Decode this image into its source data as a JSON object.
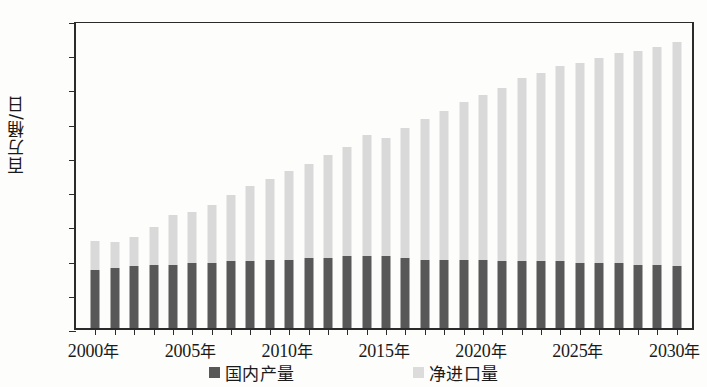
{
  "chart_data": {
    "type": "bar",
    "stacked": true,
    "title": "",
    "subtitle": "",
    "xlabel": "",
    "ylabel": "百万桶/日",
    "ylim": [
      0,
      18
    ],
    "ytick_step": 2,
    "yticks": [
      "0",
      "2",
      "4",
      "6",
      "8",
      "10",
      "12",
      "14",
      "16",
      "18"
    ],
    "grid": false,
    "legend_position": "bottom",
    "x_tick_labels": [
      "2000年",
      "2005年",
      "2010年",
      "2015年",
      "2020年",
      "2025年",
      "2030年"
    ],
    "categories": [
      "2000",
      "2001",
      "2002",
      "2003",
      "2004",
      "2005",
      "2006",
      "2007",
      "2008",
      "2009",
      "2010",
      "2011",
      "2012",
      "2013",
      "2014",
      "2015",
      "2016",
      "2017",
      "2018",
      "2019",
      "2020",
      "2021",
      "2022",
      "2023",
      "2024",
      "2025",
      "2026",
      "2027",
      "2028",
      "2029",
      "2030"
    ],
    "series": [
      {
        "name": "国内产量",
        "color": "#585858",
        "values": [
          3.4,
          3.5,
          3.6,
          3.7,
          3.7,
          3.8,
          3.8,
          3.9,
          3.9,
          4.0,
          4.0,
          4.1,
          4.1,
          4.2,
          4.2,
          4.2,
          4.1,
          4.0,
          4.0,
          4.0,
          4.0,
          3.9,
          3.9,
          3.9,
          3.9,
          3.8,
          3.8,
          3.8,
          3.7,
          3.7,
          3.6
        ]
      },
      {
        "name": "净进口量",
        "color": "#d9d9d9",
        "values": [
          1.7,
          1.5,
          1.7,
          2.2,
          2.9,
          3.0,
          3.4,
          3.9,
          4.4,
          4.7,
          5.2,
          5.5,
          6.0,
          6.4,
          7.1,
          6.9,
          7.6,
          8.2,
          8.7,
          9.2,
          9.6,
          10.1,
          10.7,
          11.0,
          11.4,
          11.7,
          12.0,
          12.3,
          12.5,
          12.7,
          13.1
        ]
      }
    ],
    "totals": [
      5.1,
      5.0,
      5.3,
      5.9,
      6.6,
      6.8,
      7.2,
      7.8,
      8.3,
      8.7,
      9.2,
      9.6,
      10.1,
      10.6,
      11.3,
      11.1,
      11.7,
      12.2,
      12.7,
      13.2,
      13.6,
      14.0,
      14.6,
      14.9,
      15.3,
      15.5,
      15.8,
      16.1,
      16.2,
      16.4,
      16.7
    ]
  },
  "legend": {
    "items": [
      {
        "label": "国内产量",
        "swatch": "dark-grey-square"
      },
      {
        "label": "净进口量",
        "swatch": "light-grey-square"
      }
    ]
  },
  "axes": {
    "y_title": "百万桶/日"
  }
}
